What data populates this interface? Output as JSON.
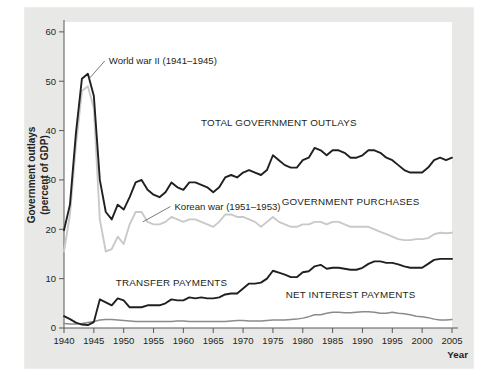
{
  "chart_data": {
    "type": "line",
    "title": "",
    "xlabel": "Year",
    "ylabel": "Government outlays (percent of GDP)",
    "ylabel_line1": "Government outlays",
    "ylabel_line2": "(percent of GDP)",
    "xlim": [
      1940,
      2005
    ],
    "ylim": [
      0,
      62
    ],
    "grid": false,
    "legend_position": "inline-labels",
    "yticks": [
      0,
      10,
      20,
      30,
      40,
      50,
      60
    ],
    "ytick_labels": [
      "0",
      "10",
      "20",
      "30",
      "40",
      "50",
      "60"
    ],
    "xticks": [
      1940,
      1945,
      1950,
      1955,
      1960,
      1965,
      1970,
      1975,
      1980,
      1985,
      1990,
      1995,
      2000,
      2005
    ],
    "xtick_labels": [
      "1940",
      "1945",
      "1950",
      "1955",
      "1960",
      "1965",
      "1970",
      "1975",
      "1980",
      "1985",
      "1990",
      "1995",
      "2000",
      "2005"
    ],
    "x": [
      1940,
      1941,
      1942,
      1943,
      1944,
      1945,
      1946,
      1947,
      1948,
      1949,
      1950,
      1951,
      1952,
      1953,
      1954,
      1955,
      1956,
      1957,
      1958,
      1959,
      1960,
      1961,
      1962,
      1963,
      1964,
      1965,
      1966,
      1967,
      1968,
      1969,
      1970,
      1971,
      1972,
      1973,
      1974,
      1975,
      1976,
      1977,
      1978,
      1979,
      1980,
      1981,
      1982,
      1983,
      1984,
      1985,
      1986,
      1987,
      1988,
      1989,
      1990,
      1991,
      1992,
      1993,
      1994,
      1995,
      1996,
      1997,
      1998,
      1999,
      2000,
      2001,
      2002,
      2003,
      2004,
      2005
    ],
    "series": [
      {
        "name": "TOTAL GOVERNMENT OUTLAYS",
        "color": "#231f20",
        "label_x": 1976,
        "label_y": 41,
        "values": [
          19.8,
          25.0,
          39.5,
          50.5,
          51.5,
          47.0,
          30.0,
          23.5,
          22.0,
          25.0,
          24.0,
          26.5,
          29.5,
          30.0,
          28.0,
          27.0,
          26.5,
          27.5,
          29.5,
          28.5,
          28.0,
          29.5,
          29.5,
          29.0,
          28.5,
          27.5,
          28.5,
          30.5,
          31.0,
          30.5,
          31.5,
          32.0,
          31.5,
          31.0,
          32.0,
          35.0,
          34.0,
          33.0,
          32.5,
          32.5,
          34.0,
          34.5,
          36.5,
          36.0,
          35.0,
          36.0,
          36.0,
          35.5,
          34.5,
          34.5,
          35.0,
          36.0,
          36.0,
          35.5,
          34.5,
          34.0,
          33.0,
          32.0,
          31.5,
          31.5,
          31.5,
          32.5,
          34.0,
          34.5,
          34.0,
          34.5
        ]
      },
      {
        "name": "GOVERNMENT PURCHASES",
        "color": "#c9c9c9",
        "label_x": 1988,
        "label_y": 25,
        "values": [
          15.5,
          23.0,
          37.0,
          48.0,
          49.0,
          44.5,
          22.0,
          15.5,
          16.0,
          18.5,
          17.0,
          21.0,
          23.5,
          23.5,
          21.5,
          21.0,
          21.0,
          21.5,
          22.5,
          22.0,
          21.5,
          22.0,
          22.0,
          21.5,
          21.0,
          20.5,
          21.5,
          23.0,
          23.0,
          22.5,
          22.5,
          22.0,
          21.5,
          20.5,
          21.5,
          22.5,
          21.5,
          21.0,
          20.5,
          20.5,
          21.0,
          21.0,
          21.5,
          21.5,
          21.0,
          21.5,
          21.5,
          21.0,
          20.5,
          20.5,
          20.5,
          20.5,
          20.0,
          19.5,
          19.0,
          18.5,
          18.0,
          17.8,
          17.8,
          18.0,
          18.0,
          18.2,
          19.0,
          19.3,
          19.2,
          19.3
        ]
      },
      {
        "name": "TRANSFER PAYMENTS",
        "color": "#231f20",
        "label_x": 1958,
        "label_y": 8.6,
        "values": [
          2.4,
          1.8,
          1.1,
          0.7,
          0.6,
          1.2,
          5.8,
          5.2,
          4.6,
          6.0,
          5.6,
          4.2,
          4.2,
          4.2,
          4.6,
          4.6,
          4.6,
          5.0,
          5.8,
          5.6,
          5.6,
          6.2,
          6.0,
          6.2,
          6.0,
          6.0,
          6.2,
          6.8,
          7.0,
          7.0,
          8.0,
          9.0,
          9.0,
          9.2,
          10.0,
          11.6,
          11.2,
          10.8,
          10.3,
          10.3,
          11.3,
          11.5,
          12.5,
          12.8,
          12.0,
          12.2,
          12.2,
          12.0,
          11.8,
          11.8,
          12.2,
          13.0,
          13.5,
          13.5,
          13.2,
          13.2,
          12.9,
          12.5,
          12.2,
          12.2,
          12.2,
          13.0,
          13.8,
          14.0,
          14.0,
          14.0
        ]
      },
      {
        "name": "NET INTEREST PAYMENTS",
        "color": "#8b8b8b",
        "label_x": 1988,
        "label_y": 6.0,
        "values": [
          0.9,
          0.8,
          0.8,
          0.9,
          1.1,
          1.3,
          1.6,
          1.7,
          1.7,
          1.6,
          1.5,
          1.4,
          1.3,
          1.3,
          1.3,
          1.3,
          1.3,
          1.3,
          1.3,
          1.4,
          1.4,
          1.3,
          1.3,
          1.3,
          1.3,
          1.3,
          1.3,
          1.3,
          1.4,
          1.5,
          1.5,
          1.4,
          1.4,
          1.4,
          1.5,
          1.6,
          1.6,
          1.6,
          1.7,
          1.8,
          2.0,
          2.3,
          2.7,
          2.7,
          3.0,
          3.2,
          3.2,
          3.1,
          3.1,
          3.2,
          3.3,
          3.3,
          3.2,
          3.0,
          3.0,
          3.2,
          3.0,
          2.9,
          2.7,
          2.4,
          2.3,
          2.1,
          1.8,
          1.6,
          1.6,
          1.7
        ]
      }
    ],
    "annotations": [
      {
        "text": "World war II (1941–1945)",
        "x": 1947.5,
        "y": 53.5,
        "point_x": 1944.2,
        "point_y": 50.5
      },
      {
        "text": "Korean war (1951–1953)",
        "x": 1958.5,
        "y": 24.0,
        "point_x": 1953.2,
        "point_y": 21.5
      }
    ]
  }
}
